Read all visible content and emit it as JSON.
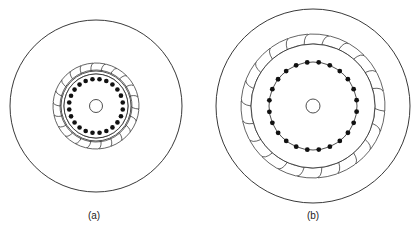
{
  "figures": [
    {
      "id": "a",
      "label": "(a)",
      "label_pos": [
        94,
        212
      ],
      "center": [
        96,
        106
      ],
      "outer_radius": 86,
      "blade_outer_radius": 43,
      "blade_inner_radius": 36,
      "blade_count": 22,
      "ring_radii": [
        35,
        32
      ],
      "dot_radius_circle": 27,
      "dot_circle_visible": false,
      "dot_count": 24,
      "dot_size": 2.3,
      "hub_radius": 6.5
    },
    {
      "id": "b",
      "label": "(b)",
      "label_pos": [
        313,
        212
      ],
      "center": [
        313,
        106
      ],
      "outer_radius": 97,
      "blade_outer_radius": 72,
      "blade_inner_radius": 62,
      "blade_count": 22,
      "ring_radii": [
        62
      ],
      "dot_radius_circle": 44,
      "dot_circle_visible": true,
      "dot_count": 24,
      "dot_size": 2.4,
      "hub_radius": 7
    }
  ],
  "colors": {
    "stroke": "#222222",
    "dot": "#111111",
    "background": "#ffffff"
  }
}
